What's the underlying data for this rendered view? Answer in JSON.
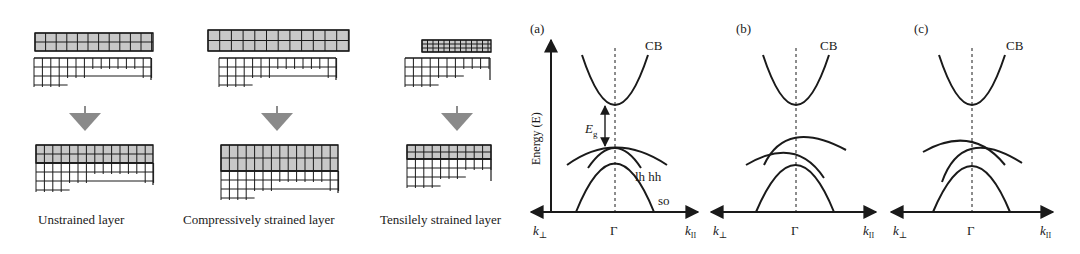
{
  "figure": {
    "left_panel": {
      "description": "Lattice-mismatch strain schematics",
      "columns": [
        {
          "id": "unstrained",
          "caption": "Unstrained layer",
          "epi_cell_width": 10.5,
          "epi_cell_height": 9
        },
        {
          "id": "compressive",
          "caption": "Compressively strained layer",
          "epi_cell_width": 10.5,
          "epi_cell_height": 10
        },
        {
          "id": "tensile",
          "caption": "Tensilely strained layer",
          "epi_cell_width": 6,
          "epi_cell_height": 5
        }
      ]
    },
    "band_panels": [
      {
        "id": "a",
        "label": "(a)",
        "cb_label": "CB",
        "gap_label": "E",
        "gap_subscript": "g",
        "vb_labels": {
          "lh": "lh",
          "hh": "hh",
          "so": "so"
        }
      },
      {
        "id": "b",
        "label": "(b)",
        "cb_label": "CB"
      },
      {
        "id": "c",
        "label": "(c)",
        "cb_label": "CB"
      }
    ],
    "axes": {
      "y_label": "Energy (E)",
      "x_left": "k",
      "x_left_sub": "⊥",
      "x_center": "Γ",
      "x_right": "k",
      "x_right_sub": "II"
    },
    "colors": {
      "line": "#1a1a1a",
      "fill": "#c8c8c8",
      "arrow": "#8a8a8a"
    }
  }
}
